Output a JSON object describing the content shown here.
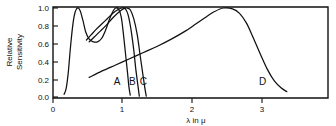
{
  "chart_data": {
    "type": "line",
    "title": "",
    "xlabel": "λ in μ",
    "ylabel": "Relative Sensitivity",
    "ylabel_line1": "Relative",
    "ylabel_line2": "Sensitivity",
    "xlim": [
      0,
      3.95
    ],
    "ylim": [
      0.0,
      1.0
    ],
    "grid": false,
    "legend": "inline-curve-labels",
    "xticks": [
      0,
      1,
      2,
      3
    ],
    "xtick_labels": [
      "0",
      "1",
      "2",
      "3"
    ],
    "yticks": [
      0.0,
      0.2,
      0.4,
      0.6,
      0.8,
      1.0
    ],
    "ytick_labels": [
      "0.0",
      "0.2",
      "0.4",
      "0.6",
      "0.8",
      "1.0"
    ],
    "series": [
      {
        "name": "A",
        "label": "A",
        "label_x": 0.92,
        "label_y": 0.13,
        "points": [
          [
            0.16,
            0.03
          ],
          [
            0.19,
            0.1
          ],
          [
            0.22,
            0.28
          ],
          [
            0.25,
            0.55
          ],
          [
            0.28,
            0.78
          ],
          [
            0.31,
            0.93
          ],
          [
            0.35,
            1.0
          ],
          [
            0.39,
            0.97
          ],
          [
            0.43,
            0.86
          ],
          [
            0.47,
            0.73
          ],
          [
            0.52,
            0.65
          ],
          [
            0.58,
            0.62
          ],
          [
            0.64,
            0.62
          ],
          [
            0.7,
            0.66
          ],
          [
            0.76,
            0.76
          ],
          [
            0.81,
            0.87
          ],
          [
            0.86,
            0.96
          ],
          [
            0.9,
            1.0
          ],
          [
            0.94,
            0.99
          ],
          [
            0.98,
            0.9
          ],
          [
            1.01,
            0.72
          ],
          [
            1.04,
            0.5
          ],
          [
            1.07,
            0.28
          ],
          [
            1.09,
            0.12
          ],
          [
            1.11,
            0.02
          ]
        ]
      },
      {
        "name": "B",
        "label": "B",
        "label_x": 1.14,
        "label_y": 0.13,
        "points": [
          [
            0.48,
            0.64
          ],
          [
            0.55,
            0.7
          ],
          [
            0.62,
            0.76
          ],
          [
            0.7,
            0.82
          ],
          [
            0.78,
            0.88
          ],
          [
            0.86,
            0.94
          ],
          [
            0.93,
            0.98
          ],
          [
            0.99,
            1.0
          ],
          [
            1.04,
            0.99
          ],
          [
            1.08,
            0.92
          ],
          [
            1.12,
            0.76
          ],
          [
            1.16,
            0.53
          ],
          [
            1.19,
            0.31
          ],
          [
            1.22,
            0.13
          ],
          [
            1.24,
            0.01
          ]
        ]
      },
      {
        "name": "C",
        "label": "C",
        "label_x": 1.3,
        "label_y": 0.13,
        "points": [
          [
            0.52,
            0.62
          ],
          [
            0.6,
            0.68
          ],
          [
            0.68,
            0.74
          ],
          [
            0.77,
            0.81
          ],
          [
            0.86,
            0.89
          ],
          [
            0.94,
            0.95
          ],
          [
            1.01,
            0.99
          ],
          [
            1.06,
            1.0
          ],
          [
            1.11,
            0.98
          ],
          [
            1.16,
            0.88
          ],
          [
            1.21,
            0.7
          ],
          [
            1.25,
            0.48
          ],
          [
            1.29,
            0.26
          ],
          [
            1.32,
            0.1
          ],
          [
            1.34,
            0.01
          ]
        ]
      },
      {
        "name": "D",
        "label": "D",
        "label_x": 3.01,
        "label_y": 0.14,
        "points": [
          [
            0.52,
            0.22
          ],
          [
            0.7,
            0.29
          ],
          [
            0.9,
            0.36
          ],
          [
            1.1,
            0.43
          ],
          [
            1.3,
            0.5
          ],
          [
            1.5,
            0.57
          ],
          [
            1.7,
            0.65
          ],
          [
            1.9,
            0.74
          ],
          [
            2.05,
            0.82
          ],
          [
            2.2,
            0.9
          ],
          [
            2.32,
            0.96
          ],
          [
            2.45,
            1.0
          ],
          [
            2.58,
            0.99
          ],
          [
            2.68,
            0.94
          ],
          [
            2.78,
            0.83
          ],
          [
            2.88,
            0.66
          ],
          [
            2.98,
            0.48
          ],
          [
            3.08,
            0.31
          ],
          [
            3.18,
            0.18
          ],
          [
            3.28,
            0.1
          ],
          [
            3.36,
            0.06
          ]
        ]
      }
    ]
  }
}
